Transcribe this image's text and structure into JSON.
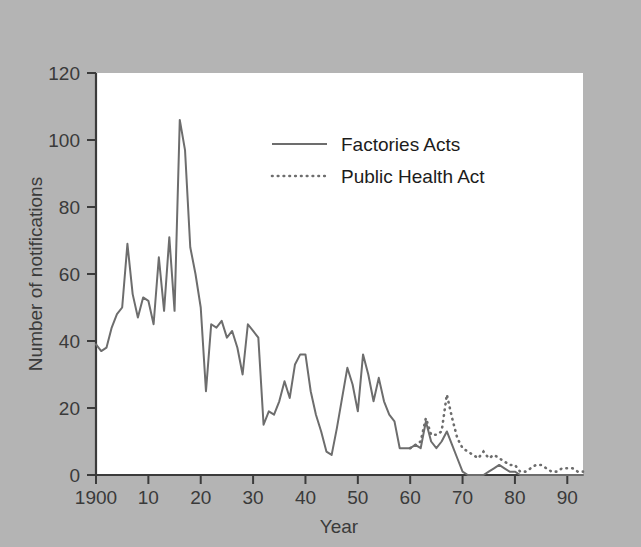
{
  "chart_data": {
    "type": "line",
    "title": "",
    "xlabel": "Year",
    "ylabel": "Number of notifications",
    "xlim": [
      1900,
      1993
    ],
    "ylim": [
      0,
      120
    ],
    "xticks": [
      1900,
      1910,
      1920,
      1930,
      1940,
      1950,
      1960,
      1970,
      1980,
      1990
    ],
    "xtick_labels": [
      "1900",
      "10",
      "20",
      "30",
      "40",
      "50",
      "60",
      "70",
      "80",
      "90"
    ],
    "yticks": [
      0,
      20,
      40,
      60,
      80,
      100,
      120
    ],
    "ytick_labels": [
      "0",
      "20",
      "40",
      "60",
      "80",
      "100",
      "120"
    ],
    "grid": false,
    "legend_position": "upper center",
    "series": [
      {
        "name": "Factories Acts",
        "style": "solid",
        "color": "#6d6d6d",
        "x": [
          1900,
          1901,
          1902,
          1903,
          1904,
          1905,
          1906,
          1907,
          1908,
          1909,
          1910,
          1911,
          1912,
          1913,
          1914,
          1915,
          1916,
          1917,
          1918,
          1919,
          1920,
          1921,
          1922,
          1923,
          1924,
          1925,
          1926,
          1927,
          1928,
          1929,
          1930,
          1931,
          1932,
          1933,
          1934,
          1935,
          1936,
          1937,
          1938,
          1939,
          1940,
          1941,
          1942,
          1943,
          1944,
          1945,
          1946,
          1947,
          1948,
          1949,
          1950,
          1951,
          1952,
          1953,
          1954,
          1955,
          1956,
          1957,
          1958,
          1959,
          1960,
          1961,
          1962,
          1963,
          1964,
          1965,
          1966,
          1967,
          1968,
          1969,
          1970,
          1971,
          1972,
          1973,
          1974,
          1975,
          1976,
          1977,
          1978,
          1979,
          1980,
          1981,
          1982,
          1983,
          1984,
          1985,
          1986,
          1987,
          1988,
          1989,
          1990,
          1991,
          1992,
          1993
        ],
        "y": [
          39,
          37,
          38,
          44,
          48,
          50,
          69,
          54,
          47,
          53,
          52,
          45,
          65,
          49,
          71,
          49,
          106,
          97,
          68,
          60,
          50,
          25,
          45,
          44,
          46,
          41,
          43,
          38,
          30,
          45,
          43,
          41,
          15,
          19,
          18,
          22,
          28,
          23,
          33,
          36,
          36,
          25,
          18,
          13,
          7,
          6,
          14,
          23,
          32,
          27,
          19,
          36,
          30,
          22,
          29,
          22,
          18,
          16,
          8,
          8,
          8,
          9,
          8,
          16,
          10,
          8,
          10,
          13,
          9,
          5,
          1,
          0,
          0,
          0,
          0,
          1,
          2,
          3,
          2,
          1,
          1,
          0,
          0,
          0,
          0,
          0,
          0,
          0,
          0,
          0,
          0,
          0,
          0,
          0
        ]
      },
      {
        "name": "Public Health Act",
        "style": "dotted",
        "color": "#6d6d6d",
        "x": [
          1960,
          1961,
          1962,
          1963,
          1964,
          1965,
          1966,
          1967,
          1968,
          1969,
          1970,
          1971,
          1972,
          1973,
          1974,
          1975,
          1976,
          1977,
          1978,
          1979,
          1980,
          1981,
          1982,
          1983,
          1984,
          1985,
          1986,
          1987,
          1988,
          1989,
          1990,
          1991,
          1992,
          1993
        ],
        "y": [
          8,
          9,
          10,
          17,
          12,
          12,
          13,
          24,
          17,
          11,
          8,
          7,
          6,
          5,
          7,
          5,
          6,
          5,
          4,
          3,
          3,
          1,
          1,
          2,
          3,
          3,
          2,
          1,
          1,
          2,
          2,
          2,
          1,
          1
        ]
      }
    ]
  },
  "axes": {
    "ylabel": "Number of notifications",
    "xlabel": "Year"
  },
  "legend": {
    "items": [
      {
        "label": "Factories Acts",
        "style": "solid"
      },
      {
        "label": "Public Health Act",
        "style": "dotted"
      }
    ]
  }
}
